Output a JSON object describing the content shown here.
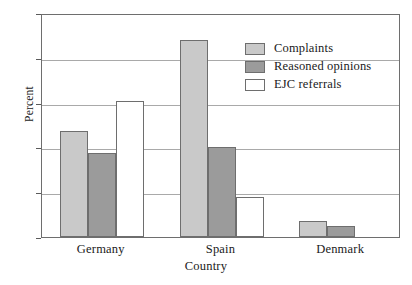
{
  "chart_data": {
    "type": "bar",
    "title": "",
    "xlabel": "Country",
    "ylabel": "Percent",
    "categories": [
      "Germany",
      "Spain",
      "Denmark"
    ],
    "series": [
      {
        "name": "Complaints",
        "values": [
          11.8,
          22.0,
          1.8
        ],
        "color": "#c9c9c9"
      },
      {
        "name": "Reasoned opinions",
        "values": [
          9.4,
          10.0,
          1.2
        ],
        "color": "#9b9b9b"
      },
      {
        "name": "EJC referrals",
        "values": [
          15.2,
          4.5,
          0.0
        ],
        "color": "#ffffff"
      }
    ],
    "ylim": [
      0,
      25
    ],
    "yticks": [
      0,
      5,
      10,
      15,
      20,
      25
    ],
    "ytick_labels": [
      "0",
      "5",
      "10",
      "15",
      "20",
      "25"
    ],
    "grid": true,
    "legend_position": "upper right",
    "frame": true
  },
  "axes": {
    "y_title": "Percent",
    "x_title": "Country"
  },
  "legend": {
    "entries": [
      {
        "label": "Complaints"
      },
      {
        "label": "Reasoned opinions"
      },
      {
        "label": "EJC referrals"
      }
    ]
  }
}
